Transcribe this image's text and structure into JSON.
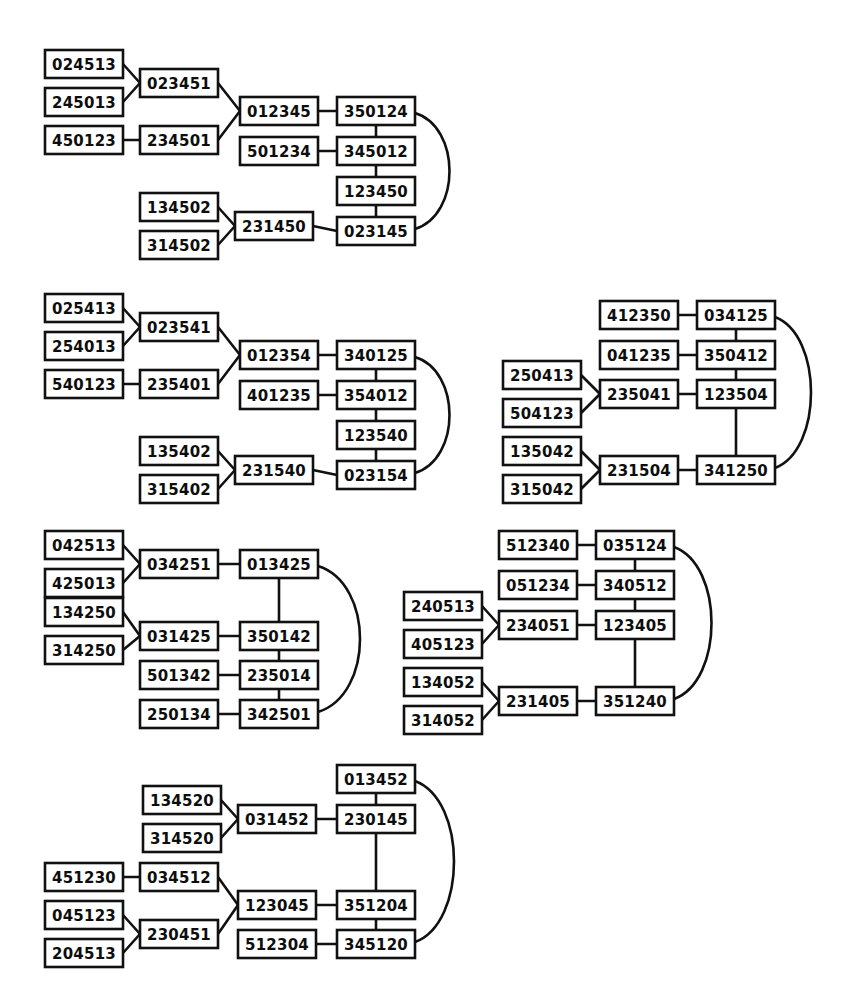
{
  "page": {
    "background_color": "#ffffff",
    "ink_color": "#111111",
    "width": 849,
    "height": 1001
  },
  "chart_data": {
    "type": "diagram",
    "node_box": {
      "width": 78,
      "height": 28,
      "border_px": 2.6,
      "fill": "#ffffff",
      "stroke": "#111111"
    },
    "graphs": [
      {
        "id": "graph-1",
        "nodes": [
          {
            "id": "g1n1",
            "label": "024513",
            "x": 45,
            "y": 50
          },
          {
            "id": "g1n2",
            "label": "245013",
            "x": 45,
            "y": 88
          },
          {
            "id": "g1n3",
            "label": "450123",
            "x": 45,
            "y": 126
          },
          {
            "id": "g1n4",
            "label": "023451",
            "x": 140,
            "y": 69
          },
          {
            "id": "g1n5",
            "label": "234501",
            "x": 140,
            "y": 126
          },
          {
            "id": "g1n6",
            "label": "012345",
            "x": 240,
            "y": 97
          },
          {
            "id": "g1n7",
            "label": "501234",
            "x": 240,
            "y": 137
          },
          {
            "id": "g1n8",
            "label": "350124",
            "x": 337,
            "y": 97
          },
          {
            "id": "g1n9",
            "label": "345012",
            "x": 337,
            "y": 137
          },
          {
            "id": "g1n10",
            "label": "123450",
            "x": 337,
            "y": 177
          },
          {
            "id": "g1n11",
            "label": "023145",
            "x": 337,
            "y": 217
          },
          {
            "id": "g1n12",
            "label": "134502",
            "x": 140,
            "y": 193
          },
          {
            "id": "g1n13",
            "label": "314502",
            "x": 140,
            "y": 231
          },
          {
            "id": "g1n14",
            "label": "231450",
            "x": 235,
            "y": 212
          }
        ],
        "edges": [
          {
            "from": "g1n1",
            "to": "g1n4",
            "kind": "straight"
          },
          {
            "from": "g1n2",
            "to": "g1n4",
            "kind": "straight"
          },
          {
            "from": "g1n3",
            "to": "g1n5",
            "kind": "straight"
          },
          {
            "from": "g1n4",
            "to": "g1n6",
            "kind": "straight"
          },
          {
            "from": "g1n5",
            "to": "g1n6",
            "kind": "straight"
          },
          {
            "from": "g1n6",
            "to": "g1n8",
            "kind": "straight"
          },
          {
            "from": "g1n7",
            "to": "g1n9",
            "kind": "straight"
          },
          {
            "from": "g1n8",
            "to": "g1n9",
            "kind": "vertical"
          },
          {
            "from": "g1n9",
            "to": "g1n10",
            "kind": "vertical"
          },
          {
            "from": "g1n10",
            "to": "g1n11",
            "kind": "vertical"
          },
          {
            "from": "g1n12",
            "to": "g1n14",
            "kind": "straight"
          },
          {
            "from": "g1n13",
            "to": "g1n14",
            "kind": "straight"
          },
          {
            "from": "g1n14",
            "to": "g1n11",
            "kind": "straight"
          },
          {
            "from": "g1n8",
            "to": "g1n11",
            "kind": "curve-right",
            "bulge": 46
          }
        ]
      },
      {
        "id": "graph-2",
        "nodes": [
          {
            "id": "g2n1",
            "label": "025413",
            "x": 45,
            "y": 294
          },
          {
            "id": "g2n2",
            "label": "254013",
            "x": 45,
            "y": 332
          },
          {
            "id": "g2n3",
            "label": "540123",
            "x": 45,
            "y": 370
          },
          {
            "id": "g2n4",
            "label": "023541",
            "x": 140,
            "y": 313
          },
          {
            "id": "g2n5",
            "label": "235401",
            "x": 140,
            "y": 370
          },
          {
            "id": "g2n6",
            "label": "012354",
            "x": 240,
            "y": 341
          },
          {
            "id": "g2n7",
            "label": "401235",
            "x": 240,
            "y": 381
          },
          {
            "id": "g2n8",
            "label": "340125",
            "x": 337,
            "y": 341
          },
          {
            "id": "g2n9",
            "label": "354012",
            "x": 337,
            "y": 381
          },
          {
            "id": "g2n10",
            "label": "123540",
            "x": 337,
            "y": 421
          },
          {
            "id": "g2n11",
            "label": "023154",
            "x": 337,
            "y": 461
          },
          {
            "id": "g2n12",
            "label": "135402",
            "x": 140,
            "y": 437
          },
          {
            "id": "g2n13",
            "label": "315402",
            "x": 140,
            "y": 475
          },
          {
            "id": "g2n14",
            "label": "231540",
            "x": 235,
            "y": 456
          }
        ],
        "edges": [
          {
            "from": "g2n1",
            "to": "g2n4",
            "kind": "straight"
          },
          {
            "from": "g2n2",
            "to": "g2n4",
            "kind": "straight"
          },
          {
            "from": "g2n3",
            "to": "g2n5",
            "kind": "straight"
          },
          {
            "from": "g2n4",
            "to": "g2n6",
            "kind": "straight"
          },
          {
            "from": "g2n5",
            "to": "g2n6",
            "kind": "straight"
          },
          {
            "from": "g2n6",
            "to": "g2n8",
            "kind": "straight"
          },
          {
            "from": "g2n7",
            "to": "g2n9",
            "kind": "straight"
          },
          {
            "from": "g2n8",
            "to": "g2n9",
            "kind": "vertical"
          },
          {
            "from": "g2n9",
            "to": "g2n10",
            "kind": "vertical"
          },
          {
            "from": "g2n10",
            "to": "g2n11",
            "kind": "vertical"
          },
          {
            "from": "g2n12",
            "to": "g2n14",
            "kind": "straight"
          },
          {
            "from": "g2n13",
            "to": "g2n14",
            "kind": "straight"
          },
          {
            "from": "g2n14",
            "to": "g2n11",
            "kind": "straight"
          },
          {
            "from": "g2n8",
            "to": "g2n11",
            "kind": "curve-right",
            "bulge": 46
          }
        ]
      },
      {
        "id": "graph-3",
        "nodes": [
          {
            "id": "g3n1",
            "label": "412350",
            "x": 600,
            "y": 301
          },
          {
            "id": "g3n2",
            "label": "041235",
            "x": 600,
            "y": 341
          },
          {
            "id": "g3n3",
            "label": "250413",
            "x": 503,
            "y": 361
          },
          {
            "id": "g3n4",
            "label": "504123",
            "x": 503,
            "y": 399
          },
          {
            "id": "g3n5",
            "label": "235041",
            "x": 600,
            "y": 380
          },
          {
            "id": "g3n6",
            "label": "135042",
            "x": 503,
            "y": 437
          },
          {
            "id": "g3n7",
            "label": "315042",
            "x": 503,
            "y": 475
          },
          {
            "id": "g3n8",
            "label": "231504",
            "x": 600,
            "y": 456
          },
          {
            "id": "g3n9",
            "label": "034125",
            "x": 697,
            "y": 301
          },
          {
            "id": "g3n10",
            "label": "350412",
            "x": 697,
            "y": 341
          },
          {
            "id": "g3n11",
            "label": "123504",
            "x": 697,
            "y": 380
          },
          {
            "id": "g3n12",
            "label": "341250",
            "x": 697,
            "y": 456
          }
        ],
        "edges": [
          {
            "from": "g3n1",
            "to": "g3n9",
            "kind": "straight"
          },
          {
            "from": "g3n2",
            "to": "g3n10",
            "kind": "straight"
          },
          {
            "from": "g3n3",
            "to": "g3n5",
            "kind": "straight"
          },
          {
            "from": "g3n4",
            "to": "g3n5",
            "kind": "straight"
          },
          {
            "from": "g3n5",
            "to": "g3n11",
            "kind": "straight"
          },
          {
            "from": "g3n6",
            "to": "g3n8",
            "kind": "straight"
          },
          {
            "from": "g3n7",
            "to": "g3n8",
            "kind": "straight"
          },
          {
            "from": "g3n8",
            "to": "g3n12",
            "kind": "straight"
          },
          {
            "from": "g3n9",
            "to": "g3n10",
            "kind": "vertical"
          },
          {
            "from": "g3n10",
            "to": "g3n11",
            "kind": "vertical"
          },
          {
            "from": "g3n11",
            "to": "g3n12",
            "kind": "vertical"
          },
          {
            "from": "g3n9",
            "to": "g3n12",
            "kind": "curve-right",
            "bulge": 48
          }
        ]
      },
      {
        "id": "graph-4",
        "nodes": [
          {
            "id": "g4n1",
            "label": "042513",
            "x": 45,
            "y": 531
          },
          {
            "id": "g4n2",
            "label": "425013",
            "x": 45,
            "y": 569
          },
          {
            "id": "g4n3",
            "label": "034251",
            "x": 140,
            "y": 550
          },
          {
            "id": "g4n4",
            "label": "013425",
            "x": 240,
            "y": 550
          },
          {
            "id": "g4n5",
            "label": "134250",
            "x": 45,
            "y": 598
          },
          {
            "id": "g4n6",
            "label": "314250",
            "x": 45,
            "y": 636
          },
          {
            "id": "g4n7",
            "label": "031425",
            "x": 140,
            "y": 622
          },
          {
            "id": "g4n8",
            "label": "350142",
            "x": 240,
            "y": 622
          },
          {
            "id": "g4n9",
            "label": "501342",
            "x": 140,
            "y": 661
          },
          {
            "id": "g4n10",
            "label": "235014",
            "x": 240,
            "y": 661
          },
          {
            "id": "g4n11",
            "label": "250134",
            "x": 140,
            "y": 700
          },
          {
            "id": "g4n12",
            "label": "342501",
            "x": 240,
            "y": 700
          }
        ],
        "edges": [
          {
            "from": "g4n1",
            "to": "g4n3",
            "kind": "straight"
          },
          {
            "from": "g4n2",
            "to": "g4n3",
            "kind": "straight"
          },
          {
            "from": "g4n3",
            "to": "g4n4",
            "kind": "straight"
          },
          {
            "from": "g4n5",
            "to": "g4n7",
            "kind": "straight"
          },
          {
            "from": "g4n6",
            "to": "g4n7",
            "kind": "straight"
          },
          {
            "from": "g4n7",
            "to": "g4n8",
            "kind": "straight"
          },
          {
            "from": "g4n9",
            "to": "g4n10",
            "kind": "straight"
          },
          {
            "from": "g4n11",
            "to": "g4n12",
            "kind": "straight"
          },
          {
            "from": "g4n4",
            "to": "g4n8",
            "kind": "vertical"
          },
          {
            "from": "g4n8",
            "to": "g4n10",
            "kind": "vertical"
          },
          {
            "from": "g4n10",
            "to": "g4n12",
            "kind": "vertical"
          },
          {
            "from": "g4n4",
            "to": "g4n12",
            "kind": "curve-right",
            "bulge": 56
          }
        ]
      },
      {
        "id": "graph-5",
        "nodes": [
          {
            "id": "g5n1",
            "label": "512340",
            "x": 499,
            "y": 531
          },
          {
            "id": "g5n2",
            "label": "051234",
            "x": 499,
            "y": 571
          },
          {
            "id": "g5n3",
            "label": "240513",
            "x": 404,
            "y": 592
          },
          {
            "id": "g5n4",
            "label": "405123",
            "x": 404,
            "y": 630
          },
          {
            "id": "g5n5",
            "label": "234051",
            "x": 499,
            "y": 611
          },
          {
            "id": "g5n6",
            "label": "134052",
            "x": 404,
            "y": 668
          },
          {
            "id": "g5n7",
            "label": "314052",
            "x": 404,
            "y": 706
          },
          {
            "id": "g5n8",
            "label": "231405",
            "x": 499,
            "y": 687
          },
          {
            "id": "g5n9",
            "label": "035124",
            "x": 596,
            "y": 531
          },
          {
            "id": "g5n10",
            "label": "340512",
            "x": 596,
            "y": 571
          },
          {
            "id": "g5n11",
            "label": "123405",
            "x": 596,
            "y": 611
          },
          {
            "id": "g5n12",
            "label": "351240",
            "x": 596,
            "y": 687
          }
        ],
        "edges": [
          {
            "from": "g5n1",
            "to": "g5n9",
            "kind": "straight"
          },
          {
            "from": "g5n2",
            "to": "g5n10",
            "kind": "straight"
          },
          {
            "from": "g5n3",
            "to": "g5n5",
            "kind": "straight"
          },
          {
            "from": "g5n4",
            "to": "g5n5",
            "kind": "straight"
          },
          {
            "from": "g5n5",
            "to": "g5n11",
            "kind": "straight"
          },
          {
            "from": "g5n6",
            "to": "g5n8",
            "kind": "straight"
          },
          {
            "from": "g5n7",
            "to": "g5n8",
            "kind": "straight"
          },
          {
            "from": "g5n8",
            "to": "g5n12",
            "kind": "straight"
          },
          {
            "from": "g5n9",
            "to": "g5n10",
            "kind": "vertical"
          },
          {
            "from": "g5n10",
            "to": "g5n11",
            "kind": "vertical"
          },
          {
            "from": "g5n11",
            "to": "g5n12",
            "kind": "vertical"
          },
          {
            "from": "g5n9",
            "to": "g5n12",
            "kind": "curve-right",
            "bulge": 50
          }
        ]
      },
      {
        "id": "graph-6",
        "nodes": [
          {
            "id": "g6n1",
            "label": "134520",
            "x": 143,
            "y": 786
          },
          {
            "id": "g6n2",
            "label": "314520",
            "x": 143,
            "y": 824
          },
          {
            "id": "g6n3",
            "label": "031452",
            "x": 238,
            "y": 805
          },
          {
            "id": "g6n4",
            "label": "013452",
            "x": 337,
            "y": 765
          },
          {
            "id": "g6n5",
            "label": "230145",
            "x": 337,
            "y": 805
          },
          {
            "id": "g6n6",
            "label": "451230",
            "x": 45,
            "y": 863
          },
          {
            "id": "g6n7",
            "label": "034512",
            "x": 140,
            "y": 863
          },
          {
            "id": "g6n8",
            "label": "045123",
            "x": 45,
            "y": 901
          },
          {
            "id": "g6n9",
            "label": "204513",
            "x": 45,
            "y": 939
          },
          {
            "id": "g6n10",
            "label": "230451",
            "x": 140,
            "y": 920
          },
          {
            "id": "g6n11",
            "label": "123045",
            "x": 238,
            "y": 891
          },
          {
            "id": "g6n12",
            "label": "351204",
            "x": 337,
            "y": 891
          },
          {
            "id": "g6n13",
            "label": "512304",
            "x": 238,
            "y": 930
          },
          {
            "id": "g6n14",
            "label": "345120",
            "x": 337,
            "y": 930
          }
        ],
        "edges": [
          {
            "from": "g6n1",
            "to": "g6n3",
            "kind": "straight"
          },
          {
            "from": "g6n2",
            "to": "g6n3",
            "kind": "straight"
          },
          {
            "from": "g6n3",
            "to": "g6n5",
            "kind": "straight"
          },
          {
            "from": "g6n6",
            "to": "g6n7",
            "kind": "straight"
          },
          {
            "from": "g6n7",
            "to": "g6n11",
            "kind": "straight"
          },
          {
            "from": "g6n8",
            "to": "g6n10",
            "kind": "straight"
          },
          {
            "from": "g6n9",
            "to": "g6n10",
            "kind": "straight"
          },
          {
            "from": "g6n10",
            "to": "g6n11",
            "kind": "straight"
          },
          {
            "from": "g6n11",
            "to": "g6n12",
            "kind": "straight"
          },
          {
            "from": "g6n13",
            "to": "g6n14",
            "kind": "straight"
          },
          {
            "from": "g6n4",
            "to": "g6n5",
            "kind": "vertical"
          },
          {
            "from": "g6n5",
            "to": "g6n12",
            "kind": "vertical"
          },
          {
            "from": "g6n12",
            "to": "g6n14",
            "kind": "vertical"
          },
          {
            "from": "g6n4",
            "to": "g6n14",
            "kind": "curve-right",
            "bulge": 52
          }
        ]
      }
    ]
  }
}
